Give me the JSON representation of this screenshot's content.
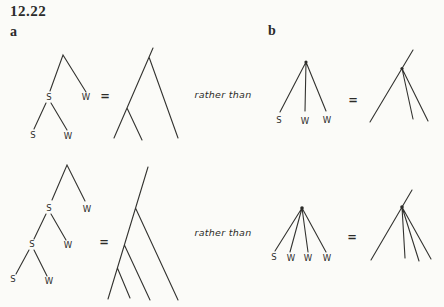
{
  "figure": {
    "number": "12.22",
    "part_a_label": "a",
    "part_b_label": "b",
    "equals": "=",
    "rather_than": "rather than"
  },
  "trees": {
    "a_top": {
      "labels": [
        "S",
        "W",
        "S",
        "W"
      ]
    },
    "a_bottom": {
      "labels": [
        "S",
        "W",
        "S",
        "W",
        "S",
        "W"
      ]
    },
    "b_top": {
      "labels": [
        "S",
        "W",
        "W"
      ]
    },
    "b_bottom": {
      "labels": [
        "S",
        "W",
        "W",
        "W"
      ]
    }
  },
  "colors": {
    "ink": "#2b2b28",
    "paper": "#fbfbf8"
  }
}
